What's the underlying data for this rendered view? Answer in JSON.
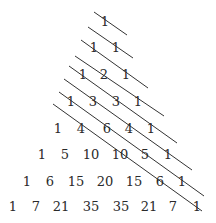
{
  "diagram": {
    "text_color": "#2a2a2a",
    "line_color": "#333333",
    "rows": [
      {
        "y": 21,
        "cells": [
          {
            "v": "1",
            "x": 105
          }
        ]
      },
      {
        "y": 47,
        "cells": [
          {
            "v": "1",
            "x": 94
          },
          {
            "v": "1",
            "x": 116
          }
        ]
      },
      {
        "y": 74,
        "cells": [
          {
            "v": "1",
            "x": 83
          },
          {
            "v": "2",
            "x": 104
          },
          {
            "v": "1",
            "x": 126
          }
        ]
      },
      {
        "y": 101,
        "cells": [
          {
            "v": "1",
            "x": 71
          },
          {
            "v": "3",
            "x": 93
          },
          {
            "v": "3",
            "x": 116
          },
          {
            "v": "1",
            "x": 138
          }
        ]
      },
      {
        "y": 128,
        "cells": [
          {
            "v": "1",
            "x": 58
          },
          {
            "v": "4",
            "x": 81
          },
          {
            "v": "6",
            "x": 107
          },
          {
            "v": "4",
            "x": 129
          },
          {
            "v": "1",
            "x": 151
          }
        ]
      },
      {
        "y": 154,
        "cells": [
          {
            "v": "1",
            "x": 42
          },
          {
            "v": "5",
            "x": 65
          },
          {
            "v": "10",
            "x": 91
          },
          {
            "v": "10",
            "x": 120
          },
          {
            "v": "5",
            "x": 145
          },
          {
            "v": "1",
            "x": 168
          }
        ]
      },
      {
        "y": 181,
        "cells": [
          {
            "v": "1",
            "x": 27
          },
          {
            "v": "6",
            "x": 50
          },
          {
            "v": "15",
            "x": 76
          },
          {
            "v": "20",
            "x": 105
          },
          {
            "v": "15",
            "x": 134
          },
          {
            "v": "6",
            "x": 160
          },
          {
            "v": "1",
            "x": 182
          }
        ]
      },
      {
        "y": 206,
        "cells": [
          {
            "v": "1",
            "x": 13
          },
          {
            "v": "7",
            "x": 36
          },
          {
            "v": "21",
            "x": 61
          },
          {
            "v": "35",
            "x": 91
          },
          {
            "v": "35",
            "x": 121
          },
          {
            "v": "21",
            "x": 149
          },
          {
            "v": "7",
            "x": 173
          },
          {
            "v": "1",
            "x": 197
          }
        ]
      }
    ],
    "diagonals": [
      {
        "x1": 94,
        "y1": 12,
        "x2": 127,
        "y2": 35
      },
      {
        "x1": 88,
        "y1": 27,
        "x2": 133,
        "y2": 58
      },
      {
        "x1": 81,
        "y1": 40,
        "x2": 148,
        "y2": 88
      },
      {
        "x1": 75,
        "y1": 56,
        "x2": 164,
        "y2": 116
      },
      {
        "x1": 69,
        "y1": 66,
        "x2": 177,
        "y2": 143
      },
      {
        "x1": 64,
        "y1": 79,
        "x2": 192,
        "y2": 170
      },
      {
        "x1": 59,
        "y1": 92,
        "x2": 204,
        "y2": 196
      },
      {
        "x1": 53,
        "y1": 104,
        "x2": 202,
        "y2": 211
      }
    ]
  }
}
